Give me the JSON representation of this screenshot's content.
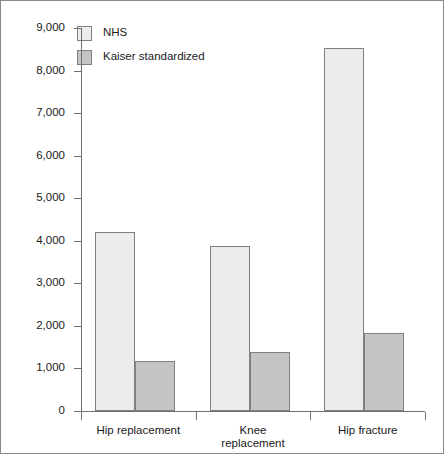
{
  "chart_data": {
    "type": "bar",
    "title": "",
    "xlabel": "",
    "ylabel": "",
    "categories": [
      "Hip replacement",
      "Knee replacement",
      "Hip fracture"
    ],
    "category_display": [
      "Hip replacement",
      "Knee\nreplacement",
      "Hip fracture"
    ],
    "series": [
      {
        "name": "NHS",
        "values": [
          4200,
          3880,
          8520
        ],
        "color": "#ececec"
      },
      {
        "name": "Kaiser standardized",
        "values": [
          1180,
          1380,
          1840
        ],
        "color": "#c4c4c4"
      }
    ],
    "ylim": [
      0,
      9000
    ],
    "ytick_values": [
      0,
      1000,
      2000,
      3000,
      4000,
      5000,
      6000,
      7000,
      8000,
      9000
    ],
    "ytick_labels": [
      "0",
      "1,000",
      "2,000",
      "3,000",
      "4,000",
      "5,000",
      "6,000",
      "7,000",
      "8,000",
      "9,000"
    ],
    "grid": false,
    "legend_position": "top-left",
    "bar_border_color": "#808080",
    "axis_color": "#6f6f6f",
    "frame_color": "#8a8a8a"
  }
}
